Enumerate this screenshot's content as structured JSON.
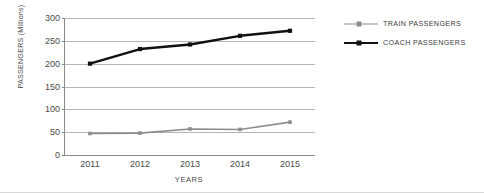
{
  "chart_data": {
    "type": "line",
    "title": "",
    "xlabel": "YEARS",
    "ylabel": "PASSENGERS (Millions)",
    "categories": [
      "2011",
      "2012",
      "2013",
      "2014",
      "2015"
    ],
    "ylim": [
      0,
      300
    ],
    "ytick_labels": [
      "0",
      "50",
      "100",
      "150",
      "200",
      "250",
      "300"
    ],
    "ytick_values": [
      0,
      50,
      100,
      150,
      200,
      250,
      300
    ],
    "grid": true,
    "legend_position": "right",
    "series": [
      {
        "name": "TRAIN PASSENGERS",
        "color": "#8c8c8c",
        "marker": "square",
        "values": [
          47,
          48,
          57,
          56,
          72
        ]
      },
      {
        "name": "COACH PASSENGERS",
        "color": "#111111",
        "marker": "square",
        "values": [
          200,
          232,
          242,
          261,
          272
        ]
      }
    ]
  }
}
